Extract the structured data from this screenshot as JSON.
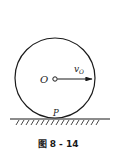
{
  "figure": {
    "caption": "图 8 - 14",
    "center_label": "O",
    "velocity_label": "v",
    "velocity_subscript": "O",
    "contact_label": "P"
  },
  "colors": {
    "stroke": "#1a1a1a",
    "background": "#ffffff"
  }
}
